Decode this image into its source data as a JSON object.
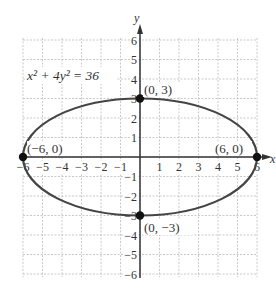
{
  "chart_data": {
    "type": "line",
    "title": "",
    "equation": "x² + 4y² = 36",
    "xlabel": "x",
    "ylabel": "y",
    "xlim": [
      -6,
      6
    ],
    "ylim": [
      -6,
      6
    ],
    "grid": true,
    "x_ticks": [
      "-6",
      "-5",
      "-4",
      "-3",
      "-2",
      "-1",
      "1",
      "2",
      "3",
      "4",
      "5",
      "6"
    ],
    "y_ticks": [
      "6",
      "5",
      "4",
      "3",
      "2",
      "1",
      "-1",
      "-2",
      "-3",
      "-4",
      "-5",
      "-6"
    ],
    "series": [
      {
        "name": "ellipse",
        "center": [
          0,
          0
        ],
        "semi_major_x": 6,
        "semi_minor_y": 3,
        "color": "#444444"
      }
    ],
    "points": [
      {
        "x": 0,
        "y": 3,
        "label": "(0, 3)"
      },
      {
        "x": -6,
        "y": 0,
        "label": "(−6, 0)"
      },
      {
        "x": 6,
        "y": 0,
        "label": "(6, 0)"
      },
      {
        "x": 0,
        "y": -3,
        "label": "(0, −3)"
      }
    ]
  },
  "labels": {
    "equation": "x² + 4y² = 36",
    "x_axis": "x",
    "y_axis": "y",
    "p_top": "(0, 3)",
    "p_left": "(−6, 0)",
    "p_right": "(6, 0)",
    "p_bottom": "(0, −3)"
  },
  "colors": {
    "grid": "#bbbbbb",
    "axis": "#333333",
    "curve": "#444444",
    "point": "#111111"
  }
}
